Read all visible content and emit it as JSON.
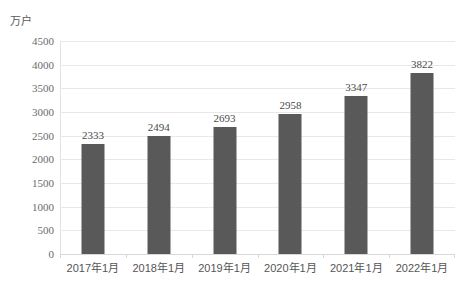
{
  "chart_data": {
    "type": "bar",
    "title": "",
    "subtitle": "",
    "xlabel": "",
    "ylabel": "万户",
    "unit_caption": "万户",
    "categories": [
      "2017年1月",
      "2018年1月",
      "2019年1月",
      "2020年1月",
      "2021年1月",
      "2022年1月"
    ],
    "values": [
      2333,
      2494,
      2693,
      2958,
      3347,
      3822
    ],
    "data_labels": [
      "2333",
      "2494",
      "2693",
      "2958",
      "3347",
      "3822"
    ],
    "ylim": [
      0,
      4500
    ],
    "y_ticks": [
      0,
      500,
      1000,
      1500,
      2000,
      2500,
      3000,
      3500,
      4000,
      4500
    ],
    "y_tick_labels": [
      "0",
      "500",
      "1000",
      "1500",
      "2000",
      "2500",
      "3000",
      "3500",
      "4000",
      "4500"
    ],
    "grid": true,
    "grid_axis": "y",
    "legend": false,
    "legend_position": "none",
    "series": [
      {
        "name": "",
        "values": [
          2333,
          2494,
          2693,
          2958,
          3347,
          3822
        ],
        "color": "#595959"
      }
    ],
    "colors": {
      "bar": "#595959",
      "gridline": "#e8e8e8",
      "axis": "#d8d8d8",
      "tick_label": "#6b6b6b",
      "data_label": "#4a4a4a",
      "background": "#ffffff"
    }
  }
}
